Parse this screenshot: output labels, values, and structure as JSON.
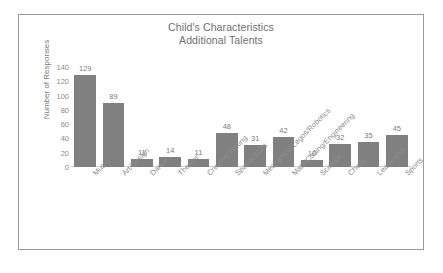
{
  "chart_data": {
    "type": "bar",
    "title": "Child's Characteristics\nAdditional Talents",
    "title_lines": [
      "Child's Characteristics",
      "Additional Talents"
    ],
    "xlabel": "",
    "ylabel": "Number of Responses",
    "ylim": [
      0,
      140
    ],
    "yticks": [
      140,
      120,
      100,
      80,
      60,
      40,
      20,
      0
    ],
    "grid": false,
    "legend": false,
    "bar_color": "#808080",
    "categories": [
      "Music",
      "Art/Design",
      "Dance",
      "Theater",
      "Creative Writing",
      "Spatial Skills",
      "Mechanical/Legos/Robotics",
      "Math/Coding/Engineering",
      "Science",
      "Chess",
      "Leadership",
      "Sports"
    ],
    "values": [
      129,
      89,
      11,
      14,
      11,
      48,
      31,
      42,
      10,
      32,
      35,
      45
    ]
  },
  "frame": {
    "border_color": "#9a9a9a",
    "background": "#ffffff"
  }
}
